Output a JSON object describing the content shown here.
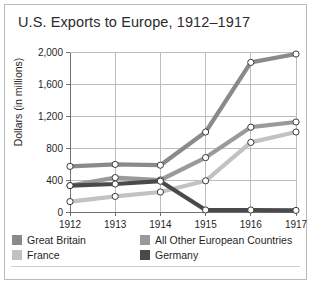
{
  "chart_data": {
    "type": "line",
    "title": "U.S. Exports to Europe, 1912–1917",
    "xlabel": "",
    "ylabel": "Dollars (in millions)",
    "x": [
      "1912",
      "1913",
      "1914",
      "1915",
      "1916",
      "1917"
    ],
    "categories": [
      "1912",
      "1913",
      "1914",
      "1915",
      "1916",
      "1917"
    ],
    "ylim": [
      0,
      2000
    ],
    "yticks": [
      0,
      400,
      800,
      1200,
      1600,
      2000
    ],
    "ytick_labels": [
      "0",
      "400",
      "800",
      "1,200",
      "1,600",
      "2,000"
    ],
    "grid": true,
    "legend_position": "bottom",
    "markers": "open-circle",
    "series": [
      {
        "name": "Great Britain",
        "color": "#8a8a8a",
        "values": [
          570,
          595,
          585,
          1000,
          1870,
          1975
        ]
      },
      {
        "name": "All Other European Countries",
        "color": "#9a9a9a",
        "values": [
          330,
          430,
          400,
          680,
          1060,
          1125
        ]
      },
      {
        "name": "France",
        "color": "#c2c2c2",
        "values": [
          130,
          195,
          250,
          390,
          870,
          1000
        ]
      },
      {
        "name": "Germany",
        "color": "#4a4a4a",
        "values": [
          330,
          350,
          385,
          25,
          25,
          20
        ]
      }
    ]
  },
  "legend": {
    "entries": [
      {
        "label": "Great Britain",
        "color": "#8a8a8a"
      },
      {
        "label": "All Other European Countries",
        "color": "#9a9a9a"
      },
      {
        "label": "France",
        "color": "#c2c2c2"
      },
      {
        "label": "Germany",
        "color": "#4a4a4a"
      }
    ]
  },
  "colors": {
    "frame": "#b9b9b9",
    "grid": "#bdbdbd",
    "axis": "#6f6f6f",
    "text": "#1f1f1f",
    "title": "#2b2b2b",
    "marker_fill": "#ffffff",
    "marker_stroke": "#3a3a3a",
    "background": "#ffffff"
  }
}
